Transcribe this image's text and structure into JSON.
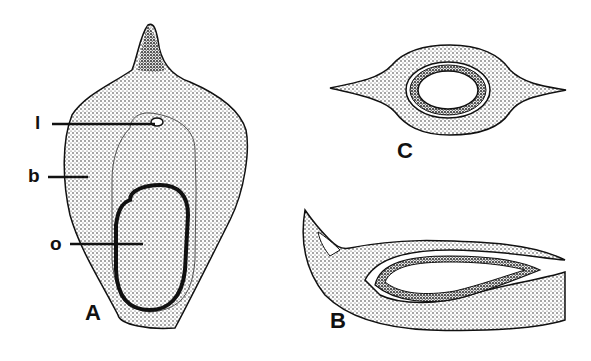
{
  "figure": {
    "panels": [
      {
        "id": "A",
        "label": "A",
        "description": "bract with ovule, face view"
      },
      {
        "id": "B",
        "label": "B",
        "description": "longitudinal section"
      },
      {
        "id": "C",
        "label": "C",
        "description": "transverse section"
      }
    ],
    "annotations": [
      {
        "key": "l",
        "label": "l"
      },
      {
        "key": "b",
        "label": "b"
      },
      {
        "key": "o",
        "label": "o"
      }
    ]
  }
}
